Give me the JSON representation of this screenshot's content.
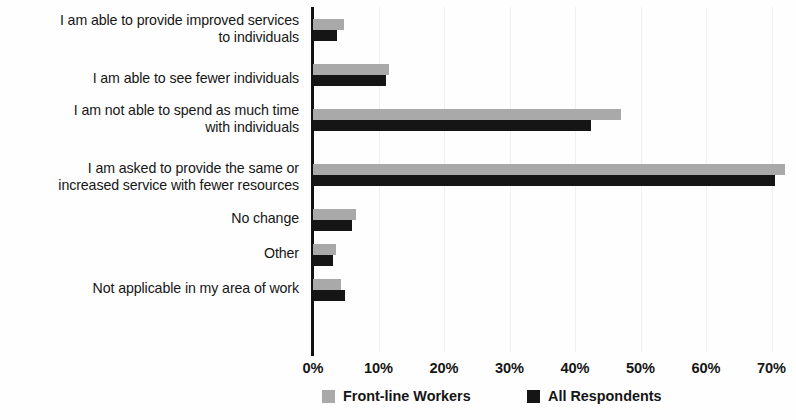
{
  "chart_data": {
    "type": "bar",
    "orientation": "horizontal",
    "title": "",
    "subtitle": "",
    "xlabel": "",
    "ylabel": "",
    "xlim": [
      0,
      75
    ],
    "grid": true,
    "legend_position": "bottom",
    "categories": [
      "I am able to provide improved services to individuals",
      "I am able to see fewer individuals",
      "I am not able to spend as much time with individuals",
      "I am asked to provide the same or increased service with fewer resources",
      "No change",
      "Other",
      "Not applicable in my area of work"
    ],
    "category_lines": [
      [
        "I am able to provide improved services",
        "to individuals"
      ],
      [
        "I am able to see fewer individuals"
      ],
      [
        "I am not able to spend as much time",
        "with individuals"
      ],
      [
        "I am asked to provide the same or",
        "increased service with fewer resources"
      ],
      [
        "No change"
      ],
      [
        "Other"
      ],
      [
        "Not applicable in my area of work"
      ]
    ],
    "series": [
      {
        "name": "Front-line Workers",
        "color": "#a9a9a9",
        "values": [
          4.7,
          11.6,
          47.0,
          72.0,
          6.6,
          3.5,
          4.3
        ]
      },
      {
        "name": "All Respondents",
        "color": "#151515",
        "values": [
          3.7,
          11.1,
          42.5,
          70.5,
          6.0,
          3.0,
          4.9
        ]
      }
    ],
    "xticks": [
      0,
      10,
      20,
      30,
      40,
      50,
      60,
      70
    ],
    "xtick_labels": [
      "0%",
      "10%",
      "20%",
      "30%",
      "40%",
      "50%",
      "60%",
      "70%"
    ]
  },
  "legend": {
    "items": [
      {
        "label": "Front-line Workers",
        "swatch": "front"
      },
      {
        "label": "All Respondents",
        "swatch": "all"
      }
    ]
  }
}
